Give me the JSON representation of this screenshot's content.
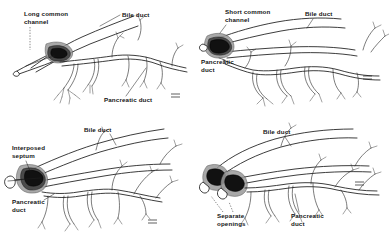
{
  "figure": {
    "background_color": "#ffffff",
    "ink_color": "#1a1a1a",
    "layout": "2x2 panel line drawing",
    "panel_count": 4
  },
  "panels": [
    {
      "id": "long-common-channel",
      "position": "top-left",
      "labels": {
        "variant": {
          "line1": "Long common",
          "line2": "channel"
        },
        "bile_duct": "Bile duct",
        "pancreatic_duct": "Pancreatic duct"
      },
      "scale_mark": "scale-mark"
    },
    {
      "id": "short-common-channel",
      "position": "top-right",
      "labels": {
        "variant": {
          "line1": "Short common",
          "line2": "channel"
        },
        "bile_duct": "Bile duct",
        "pancreatic_duct": {
          "line1": "Pancreatic",
          "line2": "duct"
        }
      },
      "scale_mark": "scale-mark"
    },
    {
      "id": "interposed-septum",
      "position": "bottom-left",
      "labels": {
        "variant": {
          "line1": "Interposed",
          "line2": "septum"
        },
        "bile_duct": "Bile duct",
        "pancreatic_duct": {
          "line1": "Pancreatic",
          "line2": "duct"
        }
      },
      "scale_mark": "scale-mark"
    },
    {
      "id": "separate-openings",
      "position": "bottom-right",
      "labels": {
        "variant": {
          "line1": "Separate",
          "line2": "openings"
        },
        "bile_duct": "Bile duct",
        "pancreatic_duct": {
          "line1": "Pancreatic",
          "line2": "duct"
        }
      },
      "scale_mark": "scale-mark"
    }
  ]
}
